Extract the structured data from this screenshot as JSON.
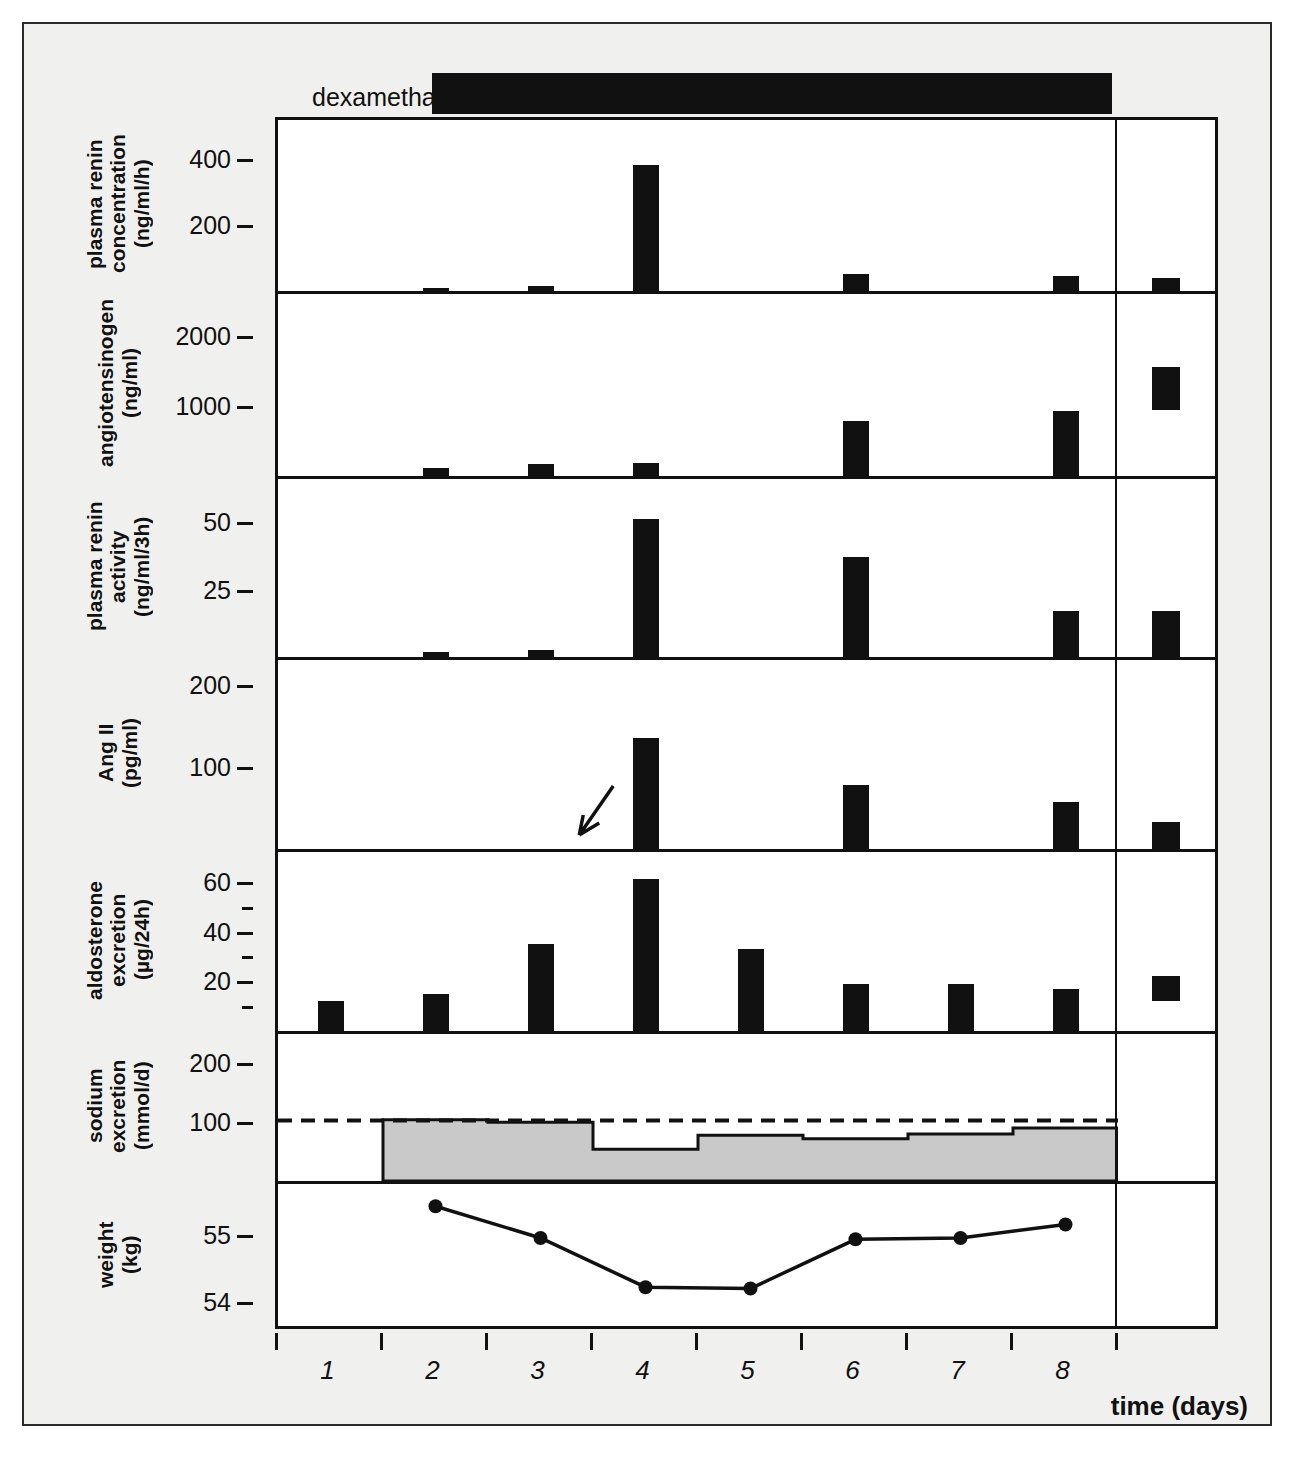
{
  "figure": {
    "treatment_label": "dexamethasone (2mg/d)",
    "normal_range_label": "normal\nrange",
    "x_axis_title": "time (days)"
  },
  "chart_data": {
    "type": "bar",
    "title": "dexamethasone (2mg/d)",
    "xlabel": "time (days)",
    "x": [
      1,
      2,
      3,
      4,
      5,
      6,
      7,
      8
    ],
    "tick_labels": [
      "1",
      "2",
      "3",
      "4",
      "5",
      "6",
      "7",
      "8"
    ],
    "treatment": {
      "label": "dexamethasone (2mg/d)",
      "dose": "2mg/d",
      "start_day": 2.1,
      "end_day": 8.5
    },
    "annotations": [
      {
        "type": "arrow",
        "panel": "Ang II",
        "day": 3.35,
        "note": "arrow marking undetectable Ang II before treatment"
      }
    ],
    "legend": [
      "normal range"
    ],
    "panels": [
      {
        "name": "plasma renin concentration",
        "label": "plasma renin\nconcentration\n(ng/ml/h)",
        "ylabel": "plasma renin concentration (ng/ml/h)",
        "units": "ng/ml/h",
        "plot_type": "bar",
        "ylim": [
          0,
          520
        ],
        "yticks": [
          200,
          400
        ],
        "ytick_labels": [
          "200",
          "400"
        ],
        "categories": [
          "1",
          "2",
          "3",
          "4",
          "5",
          "6",
          "7",
          "8"
        ],
        "values": [
          null,
          10,
          16,
          383,
          null,
          52,
          null,
          45
        ],
        "normal_range": [
          0,
          40
        ]
      },
      {
        "name": "angiotensinogen",
        "label": "angiotensinogen\n(ng/ml)",
        "ylabel": "angiotensinogen (ng/ml)",
        "units": "ng/ml",
        "plot_type": "bar",
        "ylim": [
          0,
          2600
        ],
        "yticks": [
          1000,
          2000
        ],
        "ytick_labels": [
          "1000",
          "2000"
        ],
        "categories": [
          "1",
          "2",
          "3",
          "4",
          "5",
          "6",
          "7",
          "8"
        ],
        "values": [
          null,
          110,
          170,
          190,
          null,
          780,
          null,
          930
        ],
        "normal_range": [
          950,
          1560
        ]
      },
      {
        "name": "plasma renin activity",
        "label": "plasma renin\nactivity\n(ng/ml/3h)",
        "ylabel": "plasma renin activity (ng/ml/3h)",
        "units": "ng/ml/3h",
        "plot_type": "bar",
        "ylim": [
          0,
          66
        ],
        "yticks": [
          25,
          50
        ],
        "ytick_labels": [
          "25",
          "50"
        ],
        "categories": [
          "1",
          "2",
          "3",
          "4",
          "5",
          "6",
          "7",
          "8"
        ],
        "values": [
          null,
          2.0,
          2.7,
          51,
          null,
          37,
          null,
          17
        ],
        "normal_range": [
          0,
          17
        ]
      },
      {
        "name": "Ang II",
        "label": "Ang II\n(pg/ml)",
        "ylabel": "Ang II (pg/ml)",
        "units": "pg/ml",
        "plot_type": "bar",
        "ylim": [
          0,
          230
        ],
        "yticks": [
          100,
          200
        ],
        "ytick_labels": [
          "100",
          "200"
        ],
        "categories": [
          "1",
          "2",
          "3",
          "4",
          "5",
          "6",
          "7",
          "8"
        ],
        "values": [
          null,
          null,
          null,
          135,
          null,
          78,
          null,
          57
        ],
        "normal_range": [
          0,
          33
        ]
      },
      {
        "name": "aldosterone excretion",
        "label": "aldosterone\nexcretion\n(µg/24h)",
        "ylabel": "aldosterone excretion (µg/24h)",
        "units": "µg/24h",
        "plot_type": "bar",
        "ylim": [
          0,
          72
        ],
        "yticks": [
          10,
          20,
          30,
          40,
          50,
          60
        ],
        "ytick_labels": [
          "",
          "20",
          "",
          "40",
          "",
          "60"
        ],
        "major_ticks": [
          20,
          40,
          60
        ],
        "minor_ticks": [
          10,
          30,
          50
        ],
        "categories": [
          "1",
          "2",
          "3",
          "4",
          "5",
          "6",
          "7",
          "8"
        ],
        "values": [
          12,
          15,
          35,
          61,
          33,
          19,
          19,
          17
        ],
        "normal_range": [
          12,
          22
        ]
      },
      {
        "name": "sodium excretion",
        "label": "sodium\nexcretion\n(mmol/d)",
        "ylabel": "sodium excretion (mmol/d)",
        "units": "mmol/d",
        "plot_type": "area",
        "ylim": [
          0,
          250
        ],
        "yticks": [
          100,
          200
        ],
        "ytick_labels": [
          "100",
          "200"
        ],
        "categories": [
          "1",
          "2",
          "3",
          "4",
          "5",
          "6",
          "7",
          "8"
        ],
        "values": [
          null,
          104,
          100,
          54,
          78,
          72,
          80,
          90
        ],
        "intake_line": 103,
        "intake_line_style": "dashed",
        "fill_color": "#c9c9c9"
      },
      {
        "name": "weight",
        "label": "weight\n(kg)",
        "ylabel": "weight (kg)",
        "units": "kg",
        "plot_type": "line",
        "ylim": [
          53.6,
          55.75
        ],
        "yticks": [
          54,
          55
        ],
        "ytick_labels": [
          "54",
          "55"
        ],
        "x": [
          2,
          3,
          4,
          5,
          6,
          7,
          8
        ],
        "values": [
          55.42,
          54.95,
          54.22,
          54.2,
          54.93,
          54.95,
          55.15
        ],
        "marker": "filled-circle"
      }
    ]
  }
}
